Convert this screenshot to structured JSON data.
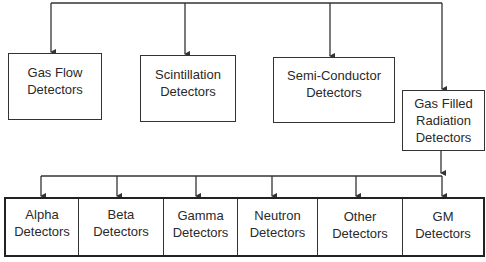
{
  "diagram": {
    "title": "",
    "top_level": [
      {
        "id": "gas-flow",
        "label": "Gas Flow\nDetectors"
      },
      {
        "id": "scintillation",
        "label": "Scintillation\nDetectors"
      },
      {
        "id": "semi-conductor",
        "label": "Semi-Conductor\nDetectors"
      },
      {
        "id": "gas-filled",
        "label": "Gas Filled\nRadiation\nDetectors"
      }
    ],
    "sub_level_parent": "gas-filled",
    "sub_level": [
      {
        "id": "alpha",
        "label": "Alpha\nDetectors"
      },
      {
        "id": "beta",
        "label": "Beta\nDetectors"
      },
      {
        "id": "gamma",
        "label": "Gamma\nDetectors"
      },
      {
        "id": "neutron",
        "label": "Neutron\nDetectors"
      },
      {
        "id": "other",
        "label": "Other\nDetectors"
      },
      {
        "id": "gm",
        "label": "GM\nDetectors"
      }
    ],
    "colors": {
      "line": "#333333",
      "background": "#ffffff",
      "text": "#2a2a2a"
    }
  }
}
